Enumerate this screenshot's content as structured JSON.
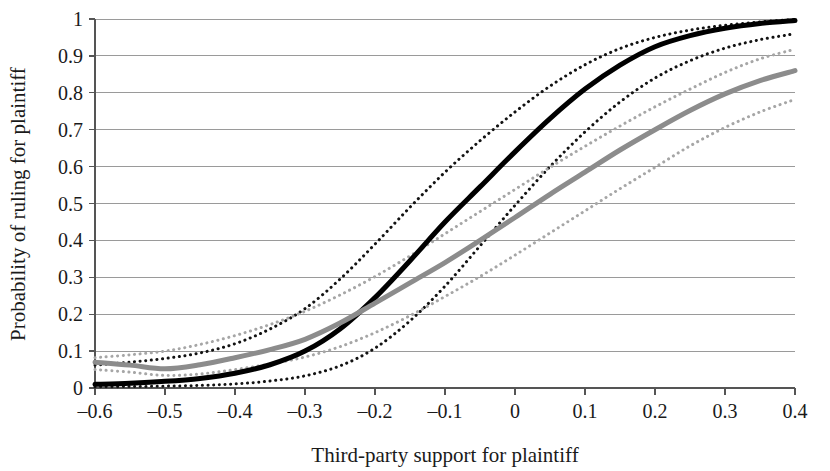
{
  "chart_data": {
    "type": "line",
    "title": "",
    "xlabel": "Third-party support for plaintiff",
    "ylabel": "Probability of ruling for plaintiff",
    "xlim": [
      -0.6,
      0.4
    ],
    "ylim": [
      0,
      1
    ],
    "grid": true,
    "grid_axis": "y",
    "legend": "none",
    "xticks": [
      -0.6,
      -0.5,
      -0.4,
      -0.3,
      -0.2,
      -0.1,
      0,
      0.1,
      0.2,
      0.3,
      0.4
    ],
    "xticklabels": [
      "–0.6",
      "–0.5",
      "–0.4",
      "–0.3",
      "–0.2",
      "–0.1",
      "0",
      "0.1",
      "0.2",
      "0.3",
      "0.4"
    ],
    "yticks": [
      0,
      0.1,
      0.2,
      0.3,
      0.4,
      0.5,
      0.6,
      0.7,
      0.8,
      0.9,
      1
    ],
    "yticklabels": [
      "0",
      "0.1",
      "0.2",
      "0.3",
      "0.4",
      "0.5",
      "0.6",
      "0.7",
      "0.8",
      "0.9",
      "1"
    ],
    "x": [
      -0.6,
      -0.55,
      -0.5,
      -0.45,
      -0.4,
      -0.35,
      -0.3,
      -0.25,
      -0.2,
      -0.15,
      -0.1,
      -0.05,
      0,
      0.05,
      0.1,
      0.15,
      0.2,
      0.25,
      0.3,
      0.35,
      0.4
    ],
    "series": [
      {
        "name": "black-estimate",
        "style": "solid",
        "color": "#000000",
        "width": 5,
        "values": [
          0.01,
          0.013,
          0.018,
          0.026,
          0.04,
          0.063,
          0.1,
          0.16,
          0.245,
          0.345,
          0.45,
          0.545,
          0.64,
          0.73,
          0.81,
          0.875,
          0.925,
          0.955,
          0.975,
          0.988,
          0.996
        ]
      },
      {
        "name": "black-upper-ci",
        "style": "dotted",
        "color": "#121212",
        "width": 3,
        "values": [
          0.062,
          0.07,
          0.08,
          0.095,
          0.12,
          0.16,
          0.215,
          0.295,
          0.39,
          0.49,
          0.585,
          0.67,
          0.748,
          0.818,
          0.876,
          0.92,
          0.95,
          0.97,
          0.983,
          0.992,
          0.999
        ]
      },
      {
        "name": "black-lower-ci",
        "style": "dotted",
        "color": "#121212",
        "width": 3,
        "values": [
          0.003,
          0.004,
          0.005,
          0.007,
          0.011,
          0.019,
          0.033,
          0.06,
          0.108,
          0.182,
          0.276,
          0.385,
          0.495,
          0.6,
          0.694,
          0.775,
          0.84,
          0.887,
          0.921,
          0.944,
          0.96
        ]
      },
      {
        "name": "gray-estimate",
        "style": "solid",
        "color": "#8c8c8c",
        "width": 5,
        "values": [
          0.07,
          0.062,
          0.052,
          0.063,
          0.082,
          0.104,
          0.132,
          0.176,
          0.23,
          0.285,
          0.34,
          0.4,
          0.462,
          0.525,
          0.585,
          0.645,
          0.7,
          0.752,
          0.797,
          0.833,
          0.86
        ]
      },
      {
        "name": "gray-upper-ci",
        "style": "dotted",
        "color": "#a6a6a6",
        "width": 3,
        "values": [
          0.082,
          0.09,
          0.1,
          0.118,
          0.142,
          0.172,
          0.208,
          0.252,
          0.302,
          0.358,
          0.418,
          0.478,
          0.538,
          0.598,
          0.655,
          0.71,
          0.762,
          0.81,
          0.855,
          0.892,
          0.918
        ]
      },
      {
        "name": "gray-lower-ci",
        "style": "dotted",
        "color": "#a6a6a6",
        "width": 3,
        "values": [
          0.05,
          0.043,
          0.034,
          0.038,
          0.05,
          0.065,
          0.084,
          0.112,
          0.15,
          0.196,
          0.248,
          0.302,
          0.36,
          0.42,
          0.48,
          0.54,
          0.598,
          0.656,
          0.706,
          0.748,
          0.782
        ]
      }
    ]
  },
  "axes": {
    "y_title": "Probability of ruling for plaintiff",
    "x_title": "Third-party support for plaintiff"
  },
  "colors": {
    "estimate_primary": "#000000",
    "estimate_secondary": "#8c8c8c",
    "grid": "#9a9a9a",
    "axis": "#555555",
    "text": "#1a1a1a",
    "background": "#ffffff"
  }
}
